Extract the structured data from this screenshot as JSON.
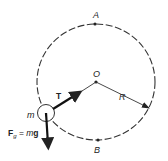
{
  "diagram": {
    "labels": {
      "top_point": "A",
      "bottom_point": "B",
      "center": "O",
      "radius": "R",
      "mass": "m",
      "tension": "T",
      "gravity_force_symbol": "F",
      "gravity_force_subscript": "g",
      "gravity_force_eq": " = ",
      "gravity_force_m": "m",
      "gravity_force_g": "g"
    },
    "colors": {
      "stroke": "#222222",
      "background": "#ffffff"
    }
  }
}
